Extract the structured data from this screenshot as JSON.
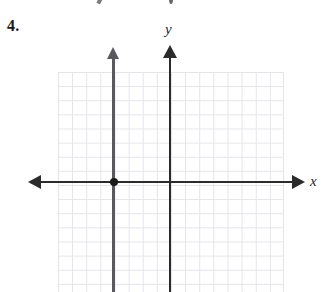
{
  "figure": {
    "problem_number": "4.",
    "background_color": "#ffffff"
  },
  "axes": {
    "x_label": "x",
    "y_label": "y",
    "axis_color": "#2b2b2b",
    "x_axis_pixel_y": 182,
    "y_axis_pixel_x": 170
  },
  "grid": {
    "color": "#e6e3e9",
    "cell_size_px": 14,
    "columns": 16,
    "rows": 16,
    "left_px": 58,
    "top_px": 72,
    "width_px": 226,
    "height_px": 220
  },
  "artifacts": {
    "top_remnant_note": "partial ink marks from the figure above, clipped at the top edge"
  },
  "chart_data": {
    "type": "line",
    "title": "",
    "xlabel": "x",
    "ylabel": "y",
    "grid": true,
    "legend": null,
    "xlim": [
      -12,
      9
    ],
    "ylim": [
      -8,
      9
    ],
    "series": [
      {
        "name": "vertical line",
        "equation": "x = -4",
        "color": "#5a5a5e",
        "orientation": "vertical",
        "x_value": -4,
        "arrow_ends": [
          "top"
        ],
        "points": [
          {
            "x": -4,
            "y": -8
          },
          {
            "x": -4,
            "y": 9
          }
        ]
      }
    ],
    "annotations": [
      {
        "type": "point",
        "name": "x-intercept",
        "x": -4,
        "y": 0,
        "color": "#1a1a1a",
        "filled": true
      }
    ]
  }
}
